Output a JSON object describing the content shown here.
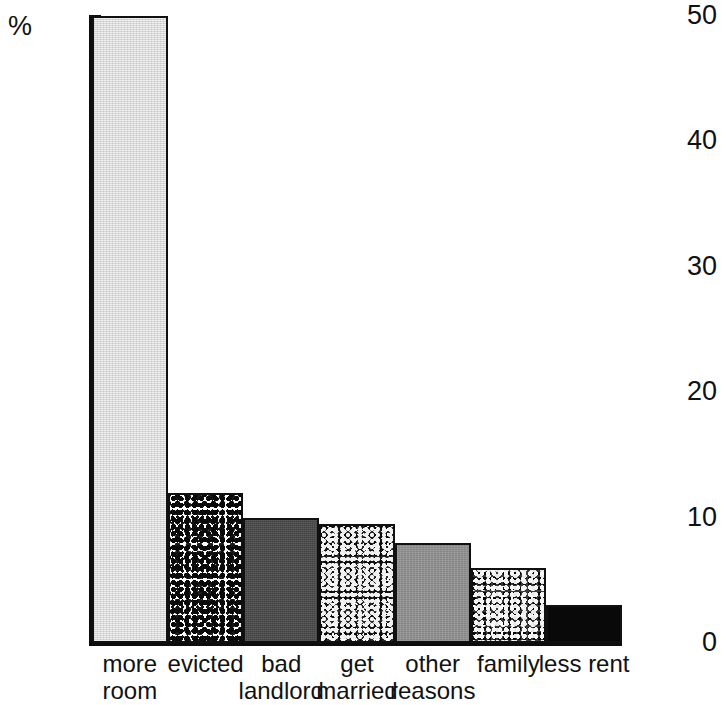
{
  "chart_data": {
    "type": "bar",
    "title": "",
    "subtitle": "",
    "xlabel": "",
    "ylabel": "%",
    "ylim": [
      0,
      50
    ],
    "yticks": [
      0,
      10,
      20,
      30,
      40,
      50
    ],
    "grid": false,
    "legend": "none",
    "categories": [
      "more room",
      "evicted",
      "bad landlord",
      "get married",
      "other reasons",
      "family",
      "less rent"
    ],
    "values": [
      50,
      12,
      10,
      9.5,
      8,
      6,
      3
    ],
    "bars": [
      {
        "label_line1": "more",
        "label_line2": "room",
        "value": 50,
        "fill": "light-gray-weave",
        "color": "#d9d9d9"
      },
      {
        "label_line1": "evicted",
        "label_line2": "",
        "value": 12,
        "fill": "white-black-speckle",
        "color": "#ffffff"
      },
      {
        "label_line1": "bad",
        "label_line2": "landlord",
        "value": 10,
        "fill": "solid-dark-gray",
        "color": "#4b4b4b"
      },
      {
        "label_line1": "get",
        "label_line2": "married",
        "value": 9.5,
        "fill": "heavy-noise",
        "color": "#2a2a2a"
      },
      {
        "label_line1": "other",
        "label_line2": "reasons",
        "value": 8,
        "fill": "solid-medium-gray",
        "color": "#939393"
      },
      {
        "label_line1": "family",
        "label_line2": "",
        "value": 6,
        "fill": "medium-noise",
        "color": "#3a3a3a"
      },
      {
        "label_line1": "less",
        "label_line2": "rent",
        "value": 3,
        "fill": "solid-black",
        "color": "#090909"
      }
    ]
  },
  "axis": {
    "y_unit_label": "%",
    "tick_labels": [
      "50",
      "40",
      "30",
      "20",
      "10",
      "0"
    ]
  }
}
